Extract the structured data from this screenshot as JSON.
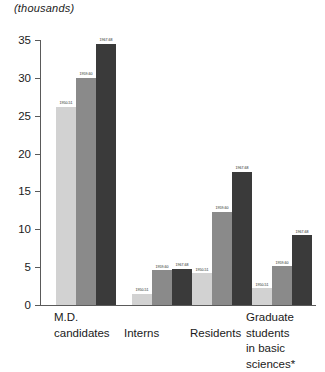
{
  "chart_data": {
    "type": "bar",
    "title": "(thousands)",
    "xlabel": "",
    "ylabel": "",
    "ylim": [
      0,
      35
    ],
    "yticks": [
      "0",
      "5",
      "10",
      "15",
      "20",
      "25",
      "30",
      "35"
    ],
    "grid": false,
    "legend_position": "none",
    "categories": [
      "M.D.\ncandidates",
      "Interns",
      "Residents",
      "Graduate students\nin basic sciences*"
    ],
    "series": [
      {
        "name": "1950-51",
        "color": "#d2d2d2",
        "values": [
          26.2,
          1.5,
          4.2,
          2.2
        ]
      },
      {
        "name": "1959-60",
        "color": "#8a8a8a",
        "values": [
          30.0,
          4.6,
          12.3,
          5.1
        ]
      },
      {
        "name": "1967-68",
        "color": "#3a3a3a",
        "values": [
          34.5,
          4.8,
          17.6,
          9.2
        ]
      }
    ],
    "bar_labels": [
      [
        "1950-51",
        "1959-60",
        "1967-68"
      ],
      [
        "1950-51",
        "1959-60",
        "1967-68"
      ],
      [
        "1950-51",
        "1959-60",
        "1967-68"
      ],
      [
        "1950-51",
        "1959-60",
        "1967-68"
      ]
    ],
    "footnote_marker": "*"
  }
}
